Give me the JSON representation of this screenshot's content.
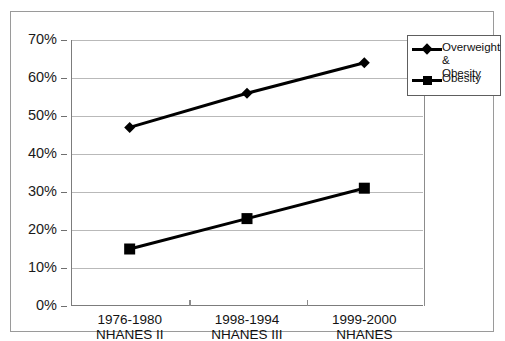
{
  "chart_data": {
    "type": "line",
    "title": "",
    "subtitle": "",
    "xlabel": "",
    "ylabel": "",
    "ylim": [
      0,
      70
    ],
    "ytick_step": 10,
    "grid": true,
    "legend_position": "top-right",
    "categories": [
      "1976-1980\nNHANES II",
      "1998-1994\nNHANES III",
      "1999-2000\nNHANES"
    ],
    "category_lines": [
      [
        "1976-1980",
        "NHANES II"
      ],
      [
        "1998-1994",
        "NHANES III"
      ],
      [
        "1999-2000",
        "NHANES"
      ]
    ],
    "ytick_labels": [
      "70%",
      "60%",
      "50%",
      "40%",
      "30%",
      "20%",
      "10%",
      "0%"
    ],
    "ytick_values": [
      70,
      60,
      50,
      40,
      30,
      20,
      10,
      0
    ],
    "series": [
      {
        "name": "Overweight & Obesity",
        "legend_label": "Overweight &\nObesity",
        "marker": "diamond",
        "color": "#000000",
        "values": [
          47,
          56,
          64
        ]
      },
      {
        "name": "Obesity",
        "legend_label": "Obesity",
        "marker": "square",
        "color": "#000000",
        "values": [
          15,
          23,
          31
        ]
      }
    ],
    "colors": {
      "series_line": "#000000",
      "gridline": "#b9b9b9",
      "axis": "#7c7c7c",
      "frame": "#9a9a9a",
      "background": "#ffffff",
      "text": "#111111"
    }
  }
}
